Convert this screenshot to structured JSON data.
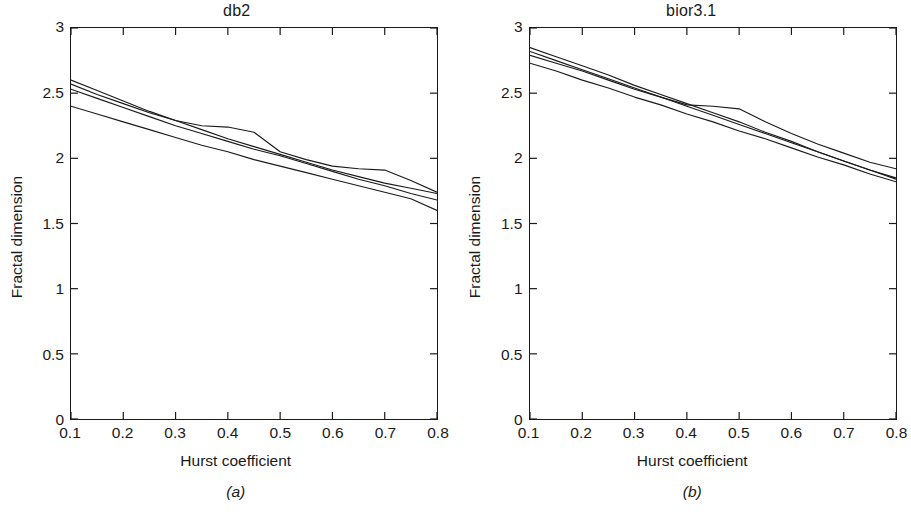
{
  "figure": {
    "background_color": "#ffffff",
    "line_color": "#1a1a1a"
  },
  "panels": [
    {
      "id": "a",
      "title": "db2",
      "subcaption": "(a)",
      "xlabel": "Hurst coefficient",
      "ylabel": "Fractal dimension",
      "xticks": [
        "0.1",
        "0.2",
        "0.3",
        "0.4",
        "0.5",
        "0.6",
        "0.7",
        "0.8"
      ],
      "yticks": [
        "0",
        "0.5",
        "1",
        "1.5",
        "2",
        "2.5",
        "3"
      ]
    },
    {
      "id": "b",
      "title": "bior3.1",
      "subcaption": "(b)",
      "xlabel": "Hurst coefficient",
      "ylabel": "Fractal dimension",
      "xticks": [
        "0.1",
        "0.2",
        "0.3",
        "0.4",
        "0.5",
        "0.6",
        "0.7",
        "0.8"
      ],
      "yticks": [
        "0",
        "0.5",
        "1",
        "1.5",
        "2",
        "2.5",
        "3"
      ]
    }
  ],
  "chart_data": [
    {
      "type": "line",
      "title": "db2",
      "subcaption": "(a)",
      "xlabel": "Hurst coefficient",
      "ylabel": "Fractal dimension",
      "xlim": [
        0.1,
        0.8
      ],
      "ylim": [
        0,
        3
      ],
      "xticks": [
        0.1,
        0.2,
        0.3,
        0.4,
        0.5,
        0.6,
        0.7,
        0.8
      ],
      "yticks": [
        0,
        0.5,
        1,
        1.5,
        2,
        2.5,
        3
      ],
      "grid": false,
      "legend": "none",
      "x": [
        0.1,
        0.15,
        0.2,
        0.25,
        0.3,
        0.35,
        0.4,
        0.45,
        0.5,
        0.55,
        0.6,
        0.65,
        0.7,
        0.75,
        0.8
      ],
      "series": [
        {
          "name": "curve-1",
          "values": [
            2.6,
            2.52,
            2.44,
            2.36,
            2.29,
            2.22,
            2.15,
            2.09,
            2.03,
            1.97,
            1.91,
            1.86,
            1.81,
            1.77,
            1.73
          ]
        },
        {
          "name": "curve-2",
          "values": [
            2.57,
            2.49,
            2.42,
            2.35,
            2.29,
            2.25,
            2.24,
            2.2,
            2.05,
            1.99,
            1.94,
            1.92,
            1.91,
            1.83,
            1.74
          ]
        },
        {
          "name": "curve-3",
          "values": [
            2.53,
            2.46,
            2.39,
            2.32,
            2.25,
            2.19,
            2.13,
            2.07,
            2.02,
            1.96,
            1.9,
            1.84,
            1.79,
            1.73,
            1.68
          ]
        },
        {
          "name": "curve-4",
          "values": [
            2.4,
            2.34,
            2.28,
            2.22,
            2.16,
            2.1,
            2.05,
            1.99,
            1.94,
            1.89,
            1.84,
            1.79,
            1.74,
            1.69,
            1.6
          ]
        }
      ]
    },
    {
      "type": "line",
      "title": "bior3.1",
      "subcaption": "(b)",
      "xlabel": "Hurst coefficient",
      "ylabel": "Fractal dimension",
      "xlim": [
        0.1,
        0.8
      ],
      "ylim": [
        0,
        3
      ],
      "xticks": [
        0.1,
        0.2,
        0.3,
        0.4,
        0.5,
        0.6,
        0.7,
        0.8
      ],
      "yticks": [
        0,
        0.5,
        1,
        1.5,
        2,
        2.5,
        3
      ],
      "grid": false,
      "legend": "none",
      "x": [
        0.1,
        0.15,
        0.2,
        0.25,
        0.3,
        0.35,
        0.4,
        0.45,
        0.5,
        0.55,
        0.6,
        0.65,
        0.7,
        0.75,
        0.8
      ],
      "series": [
        {
          "name": "curve-1",
          "values": [
            2.85,
            2.78,
            2.71,
            2.64,
            2.56,
            2.49,
            2.42,
            2.35,
            2.28,
            2.2,
            2.13,
            2.05,
            1.98,
            1.91,
            1.84
          ]
        },
        {
          "name": "curve-2",
          "values": [
            2.82,
            2.75,
            2.68,
            2.61,
            2.54,
            2.47,
            2.4,
            2.33,
            2.26,
            2.19,
            2.12,
            2.05,
            1.98,
            1.91,
            1.85
          ]
        },
        {
          "name": "curve-3",
          "values": [
            2.79,
            2.73,
            2.67,
            2.6,
            2.53,
            2.47,
            2.41,
            2.4,
            2.38,
            2.28,
            2.19,
            2.11,
            2.04,
            1.97,
            1.92
          ]
        },
        {
          "name": "curve-4",
          "values": [
            2.73,
            2.67,
            2.6,
            2.54,
            2.47,
            2.41,
            2.34,
            2.28,
            2.21,
            2.15,
            2.08,
            2.01,
            1.95,
            1.88,
            1.82
          ]
        }
      ]
    }
  ]
}
